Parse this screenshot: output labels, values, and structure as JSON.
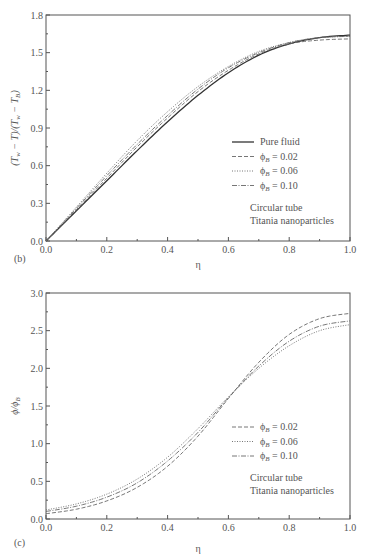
{
  "chart_data": [
    {
      "type": "line",
      "panel_label": "(b)",
      "title": "",
      "xlabel": "η",
      "ylabel": "(T_w − T)/(T_w − T_B)",
      "xlim": [
        0.0,
        1.0
      ],
      "ylim": [
        0.0,
        1.8
      ],
      "x_ticks": [
        "0.0",
        "0.2",
        "0.4",
        "0.6",
        "0.8",
        "1.0"
      ],
      "y_ticks": [
        "0.0",
        "0.3",
        "0.6",
        "0.9",
        "1.2",
        "1.5",
        "1.8"
      ],
      "grid": false,
      "legend_position": "lower right",
      "annotation": [
        "Circular tube",
        "Titania nanoparticles"
      ],
      "x": [
        0.0,
        0.1,
        0.2,
        0.3,
        0.4,
        0.5,
        0.6,
        0.7,
        0.8,
        0.9,
        1.0
      ],
      "series": [
        {
          "name": "Pure fluid",
          "style": "solid",
          "values": [
            0.0,
            0.24,
            0.48,
            0.72,
            0.95,
            1.16,
            1.34,
            1.48,
            1.57,
            1.62,
            1.64
          ]
        },
        {
          "name": "ϕB = 0.02",
          "style": "dashed",
          "values": [
            0.0,
            0.25,
            0.5,
            0.75,
            0.98,
            1.19,
            1.36,
            1.49,
            1.57,
            1.6,
            1.61
          ]
        },
        {
          "name": "ϕB = 0.06",
          "style": "dotted",
          "values": [
            0.0,
            0.27,
            0.54,
            0.8,
            1.03,
            1.23,
            1.39,
            1.51,
            1.58,
            1.62,
            1.63
          ]
        },
        {
          "name": "ϕB = 0.10",
          "style": "dashdot",
          "values": [
            0.0,
            0.26,
            0.52,
            0.77,
            1.0,
            1.21,
            1.38,
            1.5,
            1.58,
            1.62,
            1.63
          ]
        }
      ]
    },
    {
      "type": "line",
      "panel_label": "(c)",
      "title": "",
      "xlabel": "η",
      "ylabel": "ϕ/ϕB",
      "xlim": [
        0.0,
        1.0
      ],
      "ylim": [
        0.0,
        3.0
      ],
      "x_ticks": [
        "0.0",
        "0.2",
        "0.4",
        "0.6",
        "0.8",
        "1.0"
      ],
      "y_ticks": [
        "0.0",
        "0.5",
        "1.0",
        "1.5",
        "2.0",
        "2.5",
        "3.0"
      ],
      "grid": false,
      "legend_position": "lower right",
      "annotation": [
        "Circular tube",
        "Titania nanoparticles"
      ],
      "x": [
        0.0,
        0.1,
        0.2,
        0.3,
        0.4,
        0.5,
        0.6,
        0.7,
        0.8,
        0.9,
        1.0
      ],
      "series": [
        {
          "name": "ϕB = 0.02",
          "style": "dashed",
          "values": [
            0.07,
            0.13,
            0.24,
            0.42,
            0.7,
            1.1,
            1.6,
            2.08,
            2.45,
            2.66,
            2.73
          ]
        },
        {
          "name": "ϕB = 0.06",
          "style": "dotted",
          "values": [
            0.12,
            0.2,
            0.33,
            0.53,
            0.82,
            1.2,
            1.62,
            2.0,
            2.3,
            2.5,
            2.58
          ]
        },
        {
          "name": "ϕB = 0.10",
          "style": "dashdot",
          "values": [
            0.1,
            0.17,
            0.29,
            0.48,
            0.77,
            1.15,
            1.61,
            2.03,
            2.36,
            2.56,
            2.63
          ]
        }
      ]
    }
  ]
}
